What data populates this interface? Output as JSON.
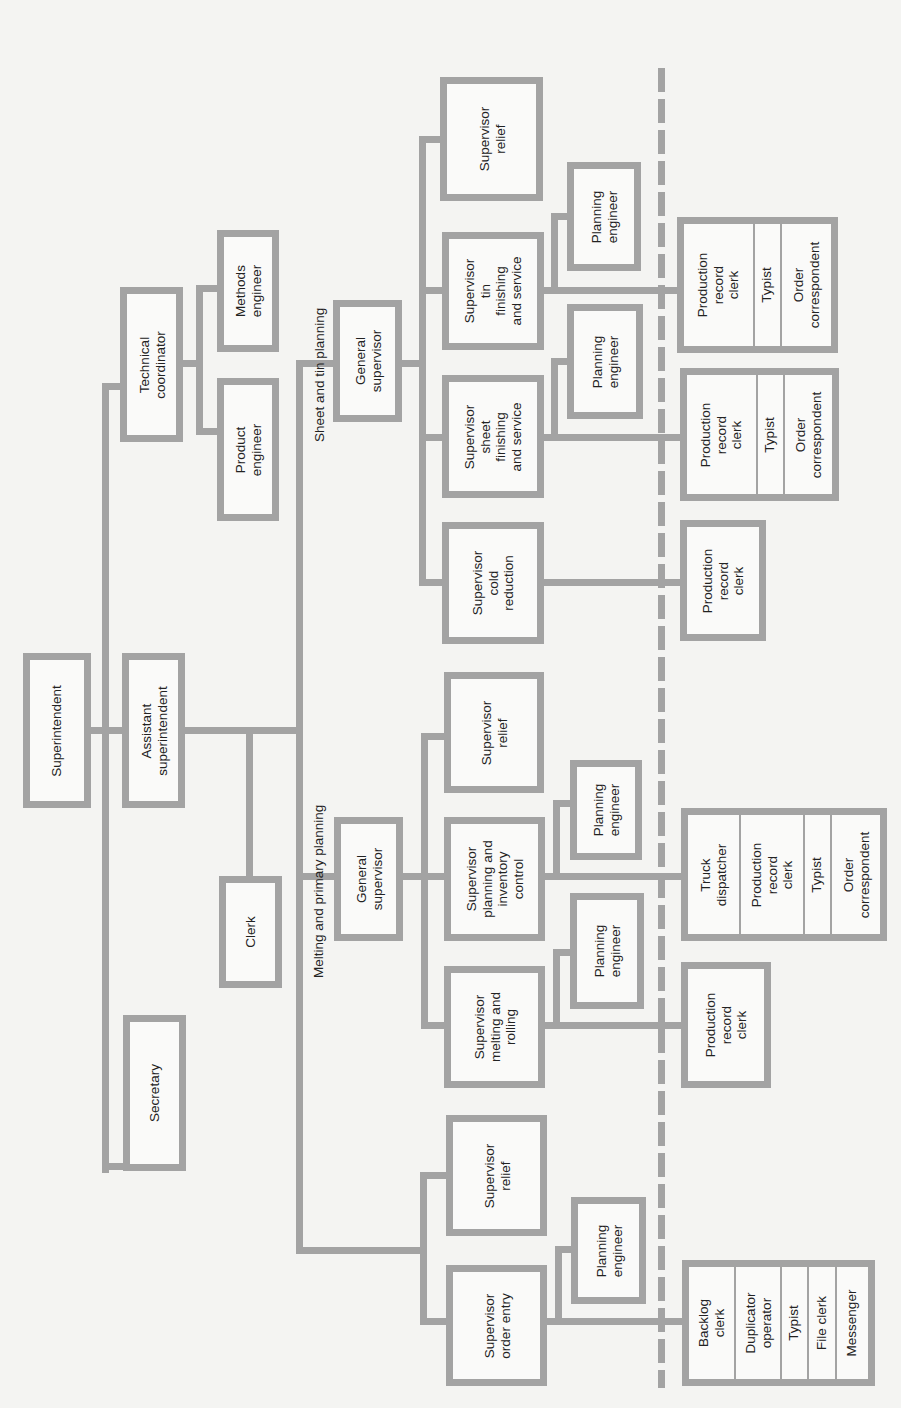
{
  "colors": {
    "line": "#a3a3a3",
    "background": "#f4f4f2",
    "box_fill": "#fafaf9",
    "text": "#222222"
  },
  "orientation": "rotated -90deg (read with page turned clockwise)",
  "departments": {
    "sheet_tin": {
      "label": "Sheet and tin planning"
    },
    "melting": {
      "label": "Melting and primary planning"
    }
  },
  "boxes": [
    {
      "id": "superintendent",
      "x": 23,
      "y": 653,
      "w": 68,
      "h": 155,
      "cells": [
        "Superintendent"
      ]
    },
    {
      "id": "assistant-superintendent",
      "x": 122,
      "y": 653,
      "w": 63,
      "h": 155,
      "cells": [
        "Assistant\nsuperintendent"
      ]
    },
    {
      "id": "technical-coordinator",
      "x": 120,
      "y": 287,
      "w": 63,
      "h": 155,
      "cells": [
        "Technical\ncoordinator"
      ]
    },
    {
      "id": "methods-engineer",
      "x": 217,
      "y": 230,
      "w": 62,
      "h": 122,
      "cells": [
        "Methods\nengineer"
      ]
    },
    {
      "id": "product-engineer",
      "x": 217,
      "y": 378,
      "w": 62,
      "h": 143,
      "cells": [
        "Product\nengineer"
      ]
    },
    {
      "id": "clerk",
      "x": 219,
      "y": 876,
      "w": 63,
      "h": 112,
      "cells": [
        "Clerk"
      ]
    },
    {
      "id": "secretary",
      "x": 123,
      "y": 1015,
      "w": 63,
      "h": 156,
      "cells": [
        "Secretary"
      ]
    },
    {
      "id": "general-supervisor-sheet-tin",
      "x": 333,
      "y": 300,
      "w": 69,
      "h": 122,
      "cells": [
        "General\nsupervisor"
      ]
    },
    {
      "id": "supervisor-relief-sheet-tin",
      "x": 440,
      "y": 77,
      "w": 103,
      "h": 124,
      "cells": [
        "Supervisor\nrelief"
      ]
    },
    {
      "id": "supervisor-tin-finishing",
      "x": 442,
      "y": 232,
      "w": 102,
      "h": 118,
      "cells": [
        "Supervisor\ntin\nfinishing\nand service"
      ]
    },
    {
      "id": "supervisor-sheet-finishing",
      "x": 442,
      "y": 375,
      "w": 102,
      "h": 123,
      "cells": [
        "Supervisor\nsheet\nfinishing\nand service"
      ]
    },
    {
      "id": "supervisor-cold-reduction",
      "x": 442,
      "y": 522,
      "w": 102,
      "h": 122,
      "cells": [
        "Supervisor\ncold\nreduction"
      ]
    },
    {
      "id": "planning-engineer-tin",
      "x": 567,
      "y": 162,
      "w": 74,
      "h": 109,
      "cells": [
        "Planning\nengineer"
      ]
    },
    {
      "id": "planning-engineer-sheet",
      "x": 567,
      "y": 304,
      "w": 76,
      "h": 115,
      "cells": [
        "Planning\nengineer"
      ]
    },
    {
      "id": "clerical-tin",
      "x": 677,
      "y": 217,
      "w": 161,
      "h": 136,
      "cells": [
        "Production\nrecord\nclerk",
        "Typist",
        "Order\ncorrespondent"
      ],
      "cell_widths": [
        72,
        27,
        62
      ]
    },
    {
      "id": "clerical-sheet",
      "x": 680,
      "y": 368,
      "w": 159,
      "h": 133,
      "cells": [
        "Production\nrecord\nclerk",
        "Typist",
        "Order\ncorrespondent"
      ],
      "cell_widths": [
        72,
        27,
        60
      ]
    },
    {
      "id": "clerical-cold-reduction",
      "x": 680,
      "y": 520,
      "w": 86,
      "h": 121,
      "cells": [
        "Production\nrecord\nclerk"
      ]
    },
    {
      "id": "general-supervisor-melting",
      "x": 334,
      "y": 817,
      "w": 69,
      "h": 124,
      "cells": [
        "General\nsupervisor"
      ]
    },
    {
      "id": "supervisor-relief-melting",
      "x": 444,
      "y": 672,
      "w": 100,
      "h": 121,
      "cells": [
        "Supervisor\nrelief"
      ]
    },
    {
      "id": "supervisor-planning-inventory",
      "x": 444,
      "y": 817,
      "w": 101,
      "h": 124,
      "cells": [
        "Supervisor\nplanning and\ninventory\ncontrol"
      ]
    },
    {
      "id": "supervisor-melting-rolling",
      "x": 444,
      "y": 966,
      "w": 101,
      "h": 122,
      "cells": [
        "Supervisor\nmelting and\nrolling"
      ]
    },
    {
      "id": "planning-engineer-inventory",
      "x": 570,
      "y": 760,
      "w": 72,
      "h": 100,
      "cells": [
        "Planning\nengineer"
      ]
    },
    {
      "id": "planning-engineer-melting",
      "x": 570,
      "y": 893,
      "w": 74,
      "h": 116,
      "cells": [
        "Planning\nengineer"
      ]
    },
    {
      "id": "clerical-inventory",
      "x": 681,
      "y": 808,
      "w": 206,
      "h": 133,
      "cells": [
        "Truck\ndispatcher",
        "Production\nrecord\nclerk",
        "Typist",
        "Order\ncorrespondent"
      ],
      "cell_widths": [
        54,
        64,
        27,
        61
      ]
    },
    {
      "id": "clerical-melting-rolling",
      "x": 681,
      "y": 962,
      "w": 90,
      "h": 126,
      "cells": [
        "Production\nrecord\nclerk"
      ]
    },
    {
      "id": "supervisor-relief-order",
      "x": 446,
      "y": 1115,
      "w": 101,
      "h": 121,
      "cells": [
        "Supervisor\nrelief"
      ]
    },
    {
      "id": "supervisor-order-entry",
      "x": 446,
      "y": 1265,
      "w": 101,
      "h": 121,
      "cells": [
        "Supervisor\norder entry"
      ]
    },
    {
      "id": "planning-engineer-order",
      "x": 571,
      "y": 1197,
      "w": 75,
      "h": 107,
      "cells": [
        "Planning\nengineer"
      ]
    },
    {
      "id": "clerical-order-entry",
      "x": 682,
      "y": 1260,
      "w": 193,
      "h": 126,
      "cells": [
        "Backlog\nclerk",
        "Duplicator\noperator",
        "Typist",
        "File clerk",
        "Messenger"
      ],
      "cell_widths": [
        48,
        46,
        27,
        28,
        44
      ]
    }
  ],
  "lines": [
    {
      "x": 102,
      "y": 383,
      "w": 7,
      "h": 790
    },
    {
      "x": 102,
      "y": 383,
      "w": 20,
      "h": 7
    },
    {
      "x": 102,
      "y": 1163,
      "w": 21,
      "h": 7
    },
    {
      "x": 90,
      "y": 727,
      "w": 32,
      "h": 7
    },
    {
      "x": 185,
      "y": 727,
      "w": 114,
      "h": 7
    },
    {
      "x": 246,
      "y": 727,
      "w": 7,
      "h": 150
    },
    {
      "x": 182,
      "y": 360,
      "w": 18,
      "h": 7
    },
    {
      "x": 196,
      "y": 285,
      "w": 7,
      "h": 150
    },
    {
      "x": 196,
      "y": 285,
      "w": 21,
      "h": 7
    },
    {
      "x": 196,
      "y": 428,
      "w": 21,
      "h": 7
    },
    {
      "x": 296,
      "y": 360,
      "w": 7,
      "h": 894
    },
    {
      "x": 296,
      "y": 360,
      "w": 37,
      "h": 7
    },
    {
      "x": 296,
      "y": 873,
      "w": 38,
      "h": 7
    },
    {
      "x": 296,
      "y": 1247,
      "w": 127,
      "h": 7
    },
    {
      "x": 402,
      "y": 360,
      "w": 21,
      "h": 7
    },
    {
      "x": 419,
      "y": 136,
      "w": 7,
      "h": 450
    },
    {
      "x": 419,
      "y": 136,
      "w": 21,
      "h": 7
    },
    {
      "x": 419,
      "y": 287,
      "w": 23,
      "h": 7
    },
    {
      "x": 419,
      "y": 434,
      "w": 23,
      "h": 7
    },
    {
      "x": 419,
      "y": 579,
      "w": 23,
      "h": 7
    },
    {
      "x": 544,
      "y": 287,
      "w": 133,
      "h": 7
    },
    {
      "x": 551,
      "y": 213,
      "w": 7,
      "h": 80
    },
    {
      "x": 551,
      "y": 213,
      "w": 16,
      "h": 7
    },
    {
      "x": 544,
      "y": 434,
      "w": 136,
      "h": 7
    },
    {
      "x": 551,
      "y": 358,
      "w": 7,
      "h": 80
    },
    {
      "x": 551,
      "y": 358,
      "w": 16,
      "h": 7
    },
    {
      "x": 544,
      "y": 579,
      "w": 136,
      "h": 7
    },
    {
      "x": 403,
      "y": 873,
      "w": 22,
      "h": 7
    },
    {
      "x": 421,
      "y": 733,
      "w": 7,
      "h": 296
    },
    {
      "x": 421,
      "y": 733,
      "w": 23,
      "h": 7
    },
    {
      "x": 421,
      "y": 873,
      "w": 23,
      "h": 7
    },
    {
      "x": 421,
      "y": 1022,
      "w": 23,
      "h": 7
    },
    {
      "x": 545,
      "y": 873,
      "w": 136,
      "h": 7
    },
    {
      "x": 553,
      "y": 800,
      "w": 7,
      "h": 80
    },
    {
      "x": 553,
      "y": 800,
      "w": 17,
      "h": 7
    },
    {
      "x": 545,
      "y": 1022,
      "w": 136,
      "h": 7
    },
    {
      "x": 553,
      "y": 949,
      "w": 7,
      "h": 80
    },
    {
      "x": 553,
      "y": 949,
      "w": 17,
      "h": 7
    },
    {
      "x": 420,
      "y": 1172,
      "w": 7,
      "h": 153
    },
    {
      "x": 420,
      "y": 1172,
      "w": 26,
      "h": 7
    },
    {
      "x": 420,
      "y": 1318,
      "w": 26,
      "h": 7
    },
    {
      "x": 547,
      "y": 1318,
      "w": 135,
      "h": 7
    },
    {
      "x": 555,
      "y": 1246,
      "w": 7,
      "h": 79
    },
    {
      "x": 555,
      "y": 1246,
      "w": 16,
      "h": 7
    }
  ],
  "dashed_divider": {
    "x": 658,
    "y_start": 68,
    "y_end": 1388,
    "dash": 24,
    "gap": 7
  },
  "dept_labels": [
    {
      "key": "sheet_tin",
      "x": 312,
      "y": 442
    },
    {
      "key": "melting",
      "x": 311,
      "y": 978
    }
  ]
}
